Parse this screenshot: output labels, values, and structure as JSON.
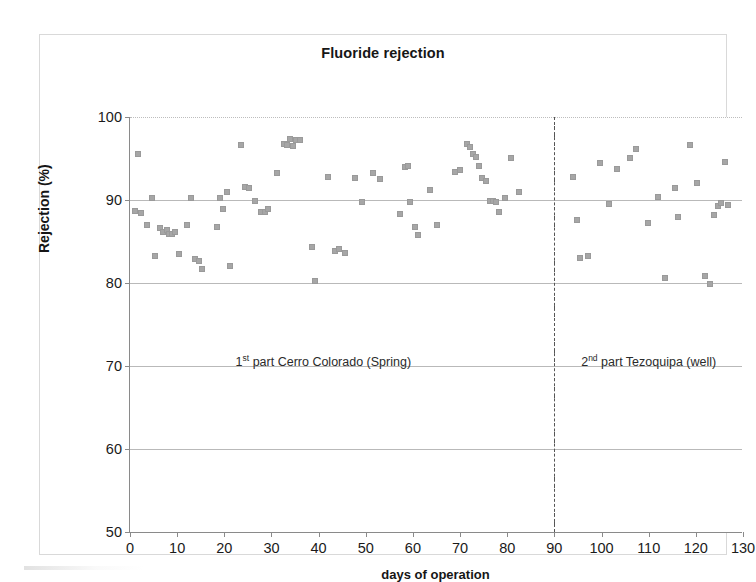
{
  "chart_data": {
    "type": "scatter",
    "title": "Fluoride rejection",
    "xlabel": "days of operation",
    "ylabel": "Rejection (%)",
    "xlim": [
      0,
      130
    ],
    "ylim": [
      50,
      100
    ],
    "xticks": [
      0,
      10,
      20,
      30,
      40,
      50,
      60,
      70,
      80,
      90,
      100,
      110,
      120,
      130
    ],
    "yticks": [
      50,
      60,
      70,
      80,
      90,
      100
    ],
    "grid": "horizontal",
    "legend": "none",
    "marker": {
      "shape": "square",
      "color": "#a6a6a6",
      "size_px": 6
    },
    "annotations": [
      {
        "name": "phase-1-label",
        "text_prefix": "1",
        "text_superscript": "st",
        "text_suffix": " part Cerro Colorado (Spring)",
        "x": 41,
        "y": 70.5
      },
      {
        "name": "phase-2-label",
        "text_prefix": "2",
        "text_superscript": "nd",
        "text_suffix": " part Tezoquipa  (well)",
        "x": 110,
        "y": 70.5
      }
    ],
    "reference_lines": [
      {
        "name": "phase-divider",
        "orientation": "vertical",
        "x": 90,
        "style": "dash-dot",
        "color": "#555555"
      }
    ],
    "series": [
      {
        "name": "Fluoride rejection",
        "points": [
          [
            1.0,
            88.7
          ],
          [
            1.6,
            95.6
          ],
          [
            2.3,
            88.4
          ],
          [
            3.5,
            87.0
          ],
          [
            4.6,
            90.2
          ],
          [
            5.3,
            83.3
          ],
          [
            6.4,
            86.6
          ],
          [
            7.1,
            86.2
          ],
          [
            7.8,
            86.4
          ],
          [
            8.2,
            85.9
          ],
          [
            8.9,
            85.9
          ],
          [
            9.6,
            86.1
          ],
          [
            10.4,
            83.5
          ],
          [
            12.1,
            87.0
          ],
          [
            13.0,
            90.3
          ],
          [
            13.8,
            82.9
          ],
          [
            14.6,
            82.6
          ],
          [
            15.2,
            81.7
          ],
          [
            18.4,
            86.8
          ],
          [
            19.0,
            90.2
          ],
          [
            19.8,
            88.9
          ],
          [
            20.6,
            91.0
          ],
          [
            21.3,
            82.1
          ],
          [
            23.5,
            96.6
          ],
          [
            24.4,
            91.6
          ],
          [
            25.2,
            91.4
          ],
          [
            26.6,
            89.9
          ],
          [
            27.8,
            88.6
          ],
          [
            28.6,
            88.5
          ],
          [
            29.3,
            88.9
          ],
          [
            31.2,
            93.3
          ],
          [
            32.6,
            96.8
          ],
          [
            33.4,
            96.6
          ],
          [
            33.9,
            97.3
          ],
          [
            34.6,
            96.5
          ],
          [
            35.3,
            97.2
          ],
          [
            36.1,
            97.2
          ],
          [
            38.5,
            84.3
          ],
          [
            39.2,
            80.3
          ],
          [
            42.0,
            92.8
          ],
          [
            43.4,
            83.9
          ],
          [
            44.4,
            84.1
          ],
          [
            45.6,
            83.6
          ],
          [
            47.8,
            92.6
          ],
          [
            49.2,
            89.7
          ],
          [
            51.5,
            93.2
          ],
          [
            53.0,
            92.5
          ],
          [
            57.2,
            88.3
          ],
          [
            58.3,
            94.0
          ],
          [
            58.9,
            94.1
          ],
          [
            59.3,
            89.8
          ],
          [
            60.4,
            86.8
          ],
          [
            61.0,
            85.8
          ],
          [
            63.6,
            91.2
          ],
          [
            65.2,
            87.0
          ],
          [
            69.0,
            93.4
          ],
          [
            70.0,
            93.6
          ],
          [
            71.4,
            96.8
          ],
          [
            72.1,
            96.4
          ],
          [
            72.8,
            95.6
          ],
          [
            73.4,
            95.2
          ],
          [
            74.0,
            94.1
          ],
          [
            74.7,
            92.6
          ],
          [
            75.4,
            92.3
          ],
          [
            76.4,
            89.9
          ],
          [
            77.0,
            89.9
          ],
          [
            77.6,
            89.7
          ],
          [
            78.3,
            88.6
          ],
          [
            79.5,
            90.3
          ],
          [
            80.8,
            95.1
          ],
          [
            82.6,
            91.0
          ],
          [
            94.0,
            92.8
          ],
          [
            94.7,
            87.6
          ],
          [
            95.4,
            83.0
          ],
          [
            97.2,
            83.2
          ],
          [
            99.6,
            94.5
          ],
          [
            101.5,
            89.5
          ],
          [
            103.2,
            93.7
          ],
          [
            106.0,
            95.1
          ],
          [
            107.4,
            96.1
          ],
          [
            109.8,
            87.2
          ],
          [
            112.0,
            90.4
          ],
          [
            113.4,
            80.6
          ],
          [
            115.5,
            91.5
          ],
          [
            116.2,
            88.0
          ],
          [
            118.8,
            96.6
          ],
          [
            120.2,
            92.0
          ],
          [
            121.9,
            80.8
          ],
          [
            123.0,
            79.9
          ],
          [
            123.8,
            88.2
          ],
          [
            124.6,
            89.3
          ],
          [
            125.4,
            89.6
          ],
          [
            126.2,
            94.6
          ],
          [
            126.8,
            89.4
          ]
        ]
      }
    ]
  }
}
